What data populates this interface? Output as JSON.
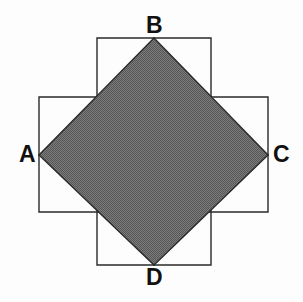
{
  "figure": {
    "background_color": "#fdfdfd",
    "canvas": {
      "width": 303,
      "height": 302
    },
    "labels": {
      "A": "A",
      "B": "B",
      "C": "C",
      "D": "D"
    },
    "shapes": {
      "vertical_square": {
        "name": "vertical-square",
        "description": "tall upright square outline",
        "x": 97,
        "y": 38,
        "width": 114,
        "height": 227,
        "fill": "none",
        "stroke_color": "#2a2a2a",
        "stroke_width": 1.4,
        "points": "97,38 211,38 211,265 97,265"
      },
      "horizontal_square": {
        "name": "horizontal-square",
        "description": "wide square outline",
        "x": 39,
        "y": 97,
        "width": 229,
        "height": 115,
        "fill": "none",
        "stroke_color": "#2a2a2a",
        "stroke_width": 1.4,
        "points": "39,97 268,97 268,212 39,212"
      },
      "shaded_diamond": {
        "name": "shaded-diamond-ABCD",
        "description": "shaded square rotated 45 degrees, vertices at A B C D",
        "fill_color": "#6e6e6e",
        "pattern": "fine-checkerboard-dither",
        "pattern_dark": "#4f4f4f",
        "pattern_light": "#898989",
        "stroke_color": "#2a2a2a",
        "stroke_width": 1.4,
        "points": "39,155 154,38 268,155 154,265",
        "vertices": [
          {
            "label": "A",
            "x": 39,
            "y": 155,
            "position": "left"
          },
          {
            "label": "B",
            "x": 154,
            "y": 38,
            "position": "top"
          },
          {
            "label": "C",
            "x": 268,
            "y": 155,
            "position": "right"
          },
          {
            "label": "D",
            "x": 154,
            "y": 265,
            "position": "bottom"
          }
        ]
      }
    }
  }
}
